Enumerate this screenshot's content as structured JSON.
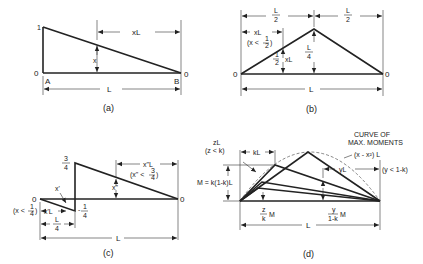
{
  "panels": {
    "a": {
      "caption": "(a)",
      "labels": {
        "top_ordinate": "1",
        "left_zero": "0",
        "right_zero": "0",
        "A": "A",
        "B": "B",
        "ordinate": "x",
        "dim_xL": "xL",
        "dim_L": "L"
      }
    },
    "b": {
      "caption": "(b)",
      "labels": {
        "left_zero": "0",
        "right_zero": "0",
        "half_left_num": "L",
        "half_left_den": "2",
        "half_right_num": "L",
        "half_right_den": "2",
        "dim_xL": "xL",
        "cond": "(x <",
        "cond_frac_num": "1",
        "cond_frac_den": "2",
        "cond_close": ")",
        "ord_frac_num": "1",
        "ord_frac_den": "2",
        "ord_suffix": "xL",
        "peak_num": "L",
        "peak_den": "4",
        "dim_L": "L"
      }
    },
    "c": {
      "caption": "(c)",
      "labels": {
        "left_zero": "0",
        "right_zero": "0",
        "top_num": "3",
        "top_den": "4",
        "bot_sign": "-",
        "bot_num": "1",
        "bot_den": "4",
        "x_prime": "x'",
        "x_dprime": "x\"",
        "dim_xpL": "x'L",
        "dim_xppL": "x\"L",
        "cond1": "(x <",
        "cond1_num": "1",
        "cond1_den": "4",
        "cond1_close": ")",
        "cond2": "(x\" <",
        "cond2_num": "3",
        "cond2_den": "4",
        "cond2_close": ")",
        "quarter_num": "L",
        "quarter_den": "4",
        "dim_L": "L"
      }
    },
    "d": {
      "caption": "(d)",
      "labels": {
        "curve_title_1": "CURVE OF",
        "curve_title_2": "MAX. MOMENTS",
        "curve_eq": "(x - x²) L",
        "dim_zL": "zL",
        "cond_z": "(z < k)",
        "dim_kL": "kL",
        "moment": "M = k(1-k)L",
        "z_num": "z",
        "z_den": "k",
        "z_suffix": "M",
        "y_num": "y",
        "y_den": "1-k",
        "y_suffix": "M",
        "dim_yL": "yL",
        "cond_y": "(y < 1-k)",
        "dim_L": "L"
      }
    }
  }
}
